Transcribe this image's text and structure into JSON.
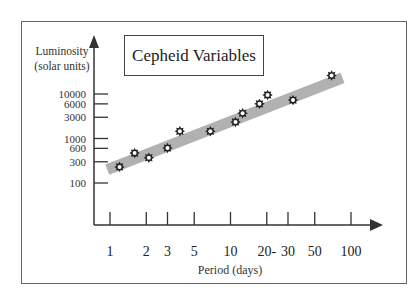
{
  "chart_data": {
    "type": "scatter",
    "title": "Cepheid Variables",
    "xlabel": "Period (days)",
    "ylabel": "Luminosity (solar units)",
    "ylabel_lines": [
      "Luminosity",
      "(solar units)"
    ],
    "x_scale": "log",
    "y_scale": "log",
    "xlim": [
      1,
      100
    ],
    "ylim": [
      100,
      10000
    ],
    "x_ticks": [
      1,
      2,
      3,
      5,
      10,
      20,
      30,
      50,
      100
    ],
    "x_tick_labels": [
      "1",
      "2",
      "3",
      "5",
      "10",
      "20-",
      "30",
      "50",
      "100"
    ],
    "y_ticks": [
      100,
      300,
      600,
      1000,
      3000,
      6000,
      10000
    ],
    "y_tick_labels": [
      "100",
      "300",
      "600",
      "1000",
      "3000",
      "6000",
      "10000"
    ],
    "grid": false,
    "legend": null,
    "series": [
      {
        "name": "Cepheid stars",
        "marker": "star",
        "points": [
          {
            "x": 1.2,
            "y": 230
          },
          {
            "x": 1.6,
            "y": 470
          },
          {
            "x": 2.1,
            "y": 370
          },
          {
            "x": 3.0,
            "y": 610
          },
          {
            "x": 3.8,
            "y": 1450
          },
          {
            "x": 6.8,
            "y": 1450
          },
          {
            "x": 11,
            "y": 2350
          },
          {
            "x": 12.6,
            "y": 3700
          },
          {
            "x": 17.4,
            "y": 6000
          },
          {
            "x": 20.3,
            "y": 9500
          },
          {
            "x": 33,
            "y": 7300
          },
          {
            "x": 69,
            "y": 26000
          }
        ]
      },
      {
        "name": "Trend band",
        "type": "line",
        "style": "thick gray band",
        "points": [
          {
            "x": 0.95,
            "y": 200
          },
          {
            "x": 85,
            "y": 23000
          }
        ]
      }
    ]
  },
  "colors": {
    "frame": "#666666",
    "axis": "#333333",
    "band": "#a9a9a9",
    "marker": "#222222",
    "background": "#ffffff"
  }
}
